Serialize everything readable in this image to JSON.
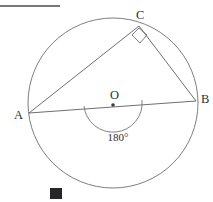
{
  "figure": {
    "type": "circle-geometry-diagram",
    "canvas": {
      "width": 213,
      "height": 202,
      "background": "#ffffff"
    },
    "colors": {
      "stroke": "#6e6e72",
      "line": "#5d5d63",
      "arc": "#74747a",
      "rule": "#4a4a50",
      "label": "#2e2e33",
      "marker": "#262628"
    },
    "circle": {
      "name": "main-circle",
      "center": {
        "x": 113,
        "y": 103
      },
      "radius": 85
    },
    "center_point": {
      "name": "center-point-o",
      "label": "O",
      "x": 113,
      "y": 105,
      "label_x": 110,
      "label_y": 96,
      "dot_radius": 1.8
    },
    "vertices": [
      {
        "name": "point-a",
        "label": "A",
        "x": 29,
        "y": 113,
        "label_x": 14,
        "label_y": 116
      },
      {
        "name": "point-b",
        "label": "B",
        "x": 196,
        "y": 101,
        "label_x": 201,
        "label_y": 100
      },
      {
        "name": "point-c",
        "label": "C",
        "x": 139,
        "y": 26,
        "label_x": 136,
        "label_y": 16
      }
    ],
    "segments": [
      {
        "name": "segment-ab",
        "from": "A",
        "to": "B",
        "x1": 29,
        "y1": 113,
        "x2": 196,
        "y2": 101
      },
      {
        "name": "segment-ac",
        "from": "A",
        "to": "C",
        "x1": 29,
        "y1": 113,
        "x2": 139,
        "y2": 26
      },
      {
        "name": "segment-cb",
        "from": "C",
        "to": "B",
        "x1": 139,
        "y1": 26,
        "x2": 196,
        "y2": 101
      }
    ],
    "right_angle_mark": {
      "name": "right-angle-mark-c",
      "at_vertex": "C",
      "measure": "90",
      "points": "139,28 147,35 140,43 132,35"
    },
    "angle_arc": {
      "name": "straight-angle-arc-o",
      "label": "180°",
      "label_x": 118,
      "label_y": 138,
      "center_x": 113,
      "center_y": 104,
      "radius": 29,
      "path": "M 84,106 A 29,29 0 0 0 142,100"
    },
    "top_rule": {
      "name": "top-horizontal-rule",
      "x1": 0,
      "y1": 6,
      "x2": 60,
      "y2": 6
    },
    "bottom_marker": {
      "name": "bottom-solid-square-marker",
      "x": 50,
      "y": 188,
      "width": 12,
      "height": 11
    }
  }
}
